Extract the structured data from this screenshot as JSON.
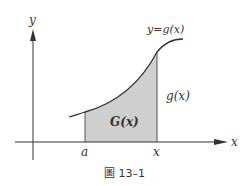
{
  "figure": {
    "axis_labels": {
      "x": "x",
      "y": "y"
    },
    "curve_label": "y=g(x)",
    "height_label": "g(x)",
    "area_label": "G(x)",
    "tick_labels": {
      "a": "a",
      "x": "x"
    },
    "caption": "圖 13–1",
    "colors": {
      "shade": "#cfcfcf",
      "stroke": "#333333"
    }
  }
}
